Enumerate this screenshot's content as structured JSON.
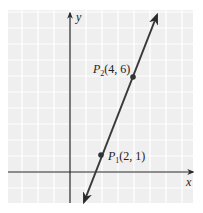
{
  "chart_data": {
    "type": "line",
    "title": "",
    "xlabel": "x",
    "ylabel": "y",
    "xlim": [
      -4,
      7.5
    ],
    "ylim": [
      -2,
      10
    ],
    "grid": true,
    "series": [
      {
        "name": "line through P1 and P2",
        "x": [
          0.9,
          5.5
        ],
        "y": [
          -1.9,
          10.1
        ]
      }
    ],
    "points": [
      {
        "label": "P1",
        "subscript": "1",
        "coords": "(2, 1)",
        "x": 2,
        "y": 1
      },
      {
        "label": "P2",
        "subscript": "2",
        "coords": "(4, 6)",
        "x": 4,
        "y": 6
      }
    ]
  },
  "axes": {
    "x_label": "x",
    "y_label": "y"
  },
  "labels": {
    "p1_letter": "P",
    "p1_sub": "1",
    "p1_coords": "(2, 1)",
    "p2_letter": "P",
    "p2_sub": "2",
    "p2_coords": "(4, 6)"
  },
  "colors": {
    "grid_bg": "#efefef",
    "grid_line": "#ffffff",
    "axis": "#222222",
    "line": "#3a3a3a",
    "point": "#333333"
  }
}
